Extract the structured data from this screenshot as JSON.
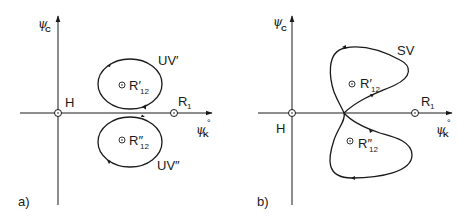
{
  "panels": [
    {
      "id": "a",
      "label": "a)",
      "axes": {
        "y_label_main": "ψ",
        "y_label_sub": "C",
        "x_label_main": "ψ",
        "x_label_sub": "K",
        "x_label_sup": "°"
      },
      "points": [
        {
          "name": "H",
          "label": "H"
        },
        {
          "name": "R1",
          "label_main": "R",
          "label_sub": "1"
        },
        {
          "name": "R12-prime",
          "label_main": "R′",
          "label_sub": "12"
        },
        {
          "name": "R12-double-prime",
          "label_main": "R″",
          "label_sub": "12"
        }
      ],
      "curves": [
        {
          "name": "UV-prime",
          "label": "UV′"
        },
        {
          "name": "UV-double-prime",
          "label": "UV″"
        }
      ]
    },
    {
      "id": "b",
      "label": "b)",
      "axes": {
        "y_label_main": "ψ",
        "y_label_sub": "C",
        "x_label_main": "ψ",
        "x_label_sub": "K",
        "x_label_sup": "°"
      },
      "points": [
        {
          "name": "H",
          "label": "H"
        },
        {
          "name": "R1",
          "label_main": "R",
          "label_sub": "1"
        },
        {
          "name": "R12-prime",
          "label_main": "R′",
          "label_sub": "12"
        },
        {
          "name": "R12-double-prime",
          "label_main": "R″",
          "label_sub": "12"
        }
      ],
      "curves": [
        {
          "name": "SV",
          "label": "SV"
        }
      ]
    }
  ],
  "colors": {
    "ink": "#1a1a1a",
    "background": "#ffffff"
  }
}
